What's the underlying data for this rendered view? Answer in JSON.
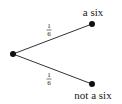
{
  "diagram": {
    "type": "probability-tree",
    "root": {
      "x": 13,
      "y": 54
    },
    "branches": [
      {
        "name": "upper",
        "end": {
          "x": 92,
          "y": 24
        },
        "probability": {
          "numerator": "1",
          "denominator": "6"
        },
        "outcome_label": "a six"
      },
      {
        "name": "lower",
        "end": {
          "x": 92,
          "y": 84
        },
        "probability": {
          "numerator": "1",
          "denominator": "6"
        },
        "outcome_label": "not a six"
      }
    ],
    "colors": {
      "line": "#333333",
      "node": "#111111",
      "text": "#1a1a1a",
      "background": "#ffffff"
    }
  }
}
